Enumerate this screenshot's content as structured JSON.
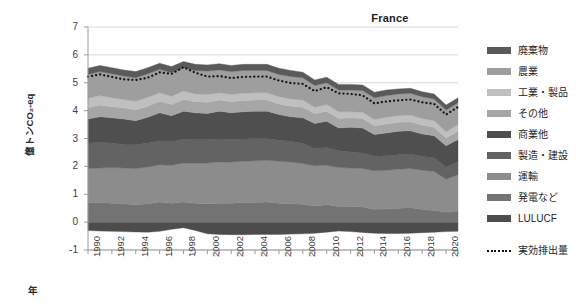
{
  "chart_data": {
    "type": "area",
    "title": "France",
    "xlabel": "年",
    "ylabel": "億トンCO₂-eq",
    "ylim": [
      -1,
      7
    ],
    "y_ticks": [
      7,
      6,
      5,
      4,
      3,
      2,
      1,
      0,
      -1
    ],
    "xlim": [
      1990,
      2021
    ],
    "x_ticks": [
      1990,
      1992,
      1994,
      1996,
      1998,
      2000,
      2002,
      2004,
      2006,
      2008,
      2010,
      2012,
      2014,
      2016,
      2018,
      2020
    ],
    "grid": true,
    "legend_position": "right",
    "stacked": true,
    "x": [
      1990,
      1991,
      1992,
      1993,
      1994,
      1995,
      1996,
      1997,
      1998,
      1999,
      2000,
      2001,
      2002,
      2003,
      2004,
      2005,
      2006,
      2007,
      2008,
      2009,
      2010,
      2011,
      2012,
      2013,
      2014,
      2015,
      2016,
      2017,
      2018,
      2019,
      2020,
      2021
    ],
    "series": [
      {
        "name": "LULUCF",
        "color": "#4c4c4c",
        "stack_order": 0,
        "values": [
          -0.3,
          -0.32,
          -0.33,
          -0.34,
          -0.35,
          -0.36,
          -0.33,
          -0.26,
          -0.2,
          -0.3,
          -0.42,
          -0.44,
          -0.45,
          -0.45,
          -0.44,
          -0.44,
          -0.44,
          -0.43,
          -0.42,
          -0.4,
          -0.36,
          -0.32,
          -0.34,
          -0.37,
          -0.4,
          -0.41,
          -0.41,
          -0.4,
          -0.38,
          -0.36,
          -0.34,
          -0.33
        ]
      },
      {
        "name": "発電など",
        "color": "#737373",
        "stack_order": 1,
        "values": [
          0.7,
          0.7,
          0.68,
          0.66,
          0.62,
          0.66,
          0.72,
          0.68,
          0.72,
          0.68,
          0.66,
          0.68,
          0.68,
          0.7,
          0.7,
          0.72,
          0.68,
          0.66,
          0.64,
          0.58,
          0.62,
          0.56,
          0.56,
          0.54,
          0.46,
          0.48,
          0.5,
          0.52,
          0.46,
          0.42,
          0.36,
          0.4
        ]
      },
      {
        "name": "運輸",
        "color": "#8c8c8c",
        "stack_order": 2,
        "values": [
          1.22,
          1.24,
          1.28,
          1.28,
          1.3,
          1.32,
          1.34,
          1.36,
          1.4,
          1.44,
          1.46,
          1.48,
          1.48,
          1.48,
          1.5,
          1.5,
          1.5,
          1.5,
          1.46,
          1.44,
          1.42,
          1.4,
          1.38,
          1.38,
          1.38,
          1.38,
          1.4,
          1.4,
          1.4,
          1.4,
          1.18,
          1.3
        ]
      },
      {
        "name": "製造・建設",
        "color": "#636363",
        "stack_order": 3,
        "values": [
          0.92,
          0.92,
          0.88,
          0.84,
          0.86,
          0.86,
          0.86,
          0.84,
          0.86,
          0.84,
          0.84,
          0.82,
          0.8,
          0.8,
          0.8,
          0.78,
          0.76,
          0.74,
          0.72,
          0.62,
          0.64,
          0.6,
          0.58,
          0.56,
          0.52,
          0.52,
          0.52,
          0.52,
          0.5,
          0.48,
          0.44,
          0.46
        ]
      },
      {
        "name": "商業他",
        "color": "#4f4f4f",
        "stack_order": 4,
        "values": [
          0.86,
          0.92,
          0.9,
          0.92,
          0.86,
          0.92,
          1.0,
          0.94,
          1.0,
          0.96,
          0.94,
          1.0,
          0.96,
          0.98,
          0.98,
          0.98,
          0.92,
          0.88,
          0.92,
          0.9,
          0.94,
          0.82,
          0.88,
          0.9,
          0.78,
          0.82,
          0.84,
          0.84,
          0.8,
          0.8,
          0.76,
          0.8
        ]
      },
      {
        "name": "その他",
        "color": "#a6a6a6",
        "stack_order": 5,
        "values": [
          0.4,
          0.42,
          0.4,
          0.4,
          0.38,
          0.4,
          0.42,
          0.4,
          0.42,
          0.4,
          0.4,
          0.4,
          0.4,
          0.4,
          0.4,
          0.4,
          0.38,
          0.38,
          0.38,
          0.36,
          0.36,
          0.34,
          0.34,
          0.34,
          0.32,
          0.32,
          0.32,
          0.32,
          0.32,
          0.3,
          0.28,
          0.3
        ]
      },
      {
        "name": "工業・製品",
        "color": "#bfbfbf",
        "stack_order": 6,
        "values": [
          0.34,
          0.34,
          0.32,
          0.3,
          0.32,
          0.32,
          0.3,
          0.3,
          0.3,
          0.28,
          0.28,
          0.26,
          0.26,
          0.26,
          0.26,
          0.26,
          0.26,
          0.26,
          0.26,
          0.22,
          0.24,
          0.24,
          0.22,
          0.22,
          0.22,
          0.24,
          0.24,
          0.24,
          0.24,
          0.24,
          0.22,
          0.24
        ]
      },
      {
        "name": "農業",
        "color": "#9e9e9e",
        "stack_order": 7,
        "values": [
          0.86,
          0.86,
          0.86,
          0.84,
          0.84,
          0.84,
          0.84,
          0.84,
          0.84,
          0.84,
          0.84,
          0.82,
          0.82,
          0.82,
          0.8,
          0.8,
          0.8,
          0.8,
          0.8,
          0.78,
          0.78,
          0.78,
          0.78,
          0.78,
          0.78,
          0.78,
          0.78,
          0.78,
          0.78,
          0.78,
          0.78,
          0.78
        ]
      },
      {
        "name": "廃棄物",
        "color": "#5a5a5a",
        "stack_order": 8,
        "values": [
          0.22,
          0.22,
          0.22,
          0.22,
          0.22,
          0.22,
          0.22,
          0.22,
          0.22,
          0.22,
          0.22,
          0.22,
          0.22,
          0.22,
          0.22,
          0.22,
          0.22,
          0.22,
          0.2,
          0.2,
          0.2,
          0.2,
          0.2,
          0.2,
          0.2,
          0.2,
          0.18,
          0.18,
          0.18,
          0.18,
          0.18,
          0.18
        ]
      }
    ],
    "net_line": {
      "name": "実効排出量",
      "style": "dotted",
      "color": "#111111",
      "values": [
        5.22,
        5.3,
        5.21,
        5.12,
        5.1,
        5.18,
        5.37,
        5.32,
        5.56,
        5.36,
        5.22,
        5.24,
        5.17,
        5.21,
        5.22,
        5.22,
        5.08,
        4.99,
        4.96,
        4.7,
        4.84,
        4.62,
        4.6,
        4.55,
        4.26,
        4.33,
        4.37,
        4.4,
        4.3,
        4.24,
        3.86,
        4.13
      ]
    }
  },
  "legend": {
    "items": [
      {
        "label": "廃棄物",
        "color": "#5a5a5a"
      },
      {
        "label": "農業",
        "color": "#9e9e9e"
      },
      {
        "label": "工業・製品",
        "color": "#bfbfbf"
      },
      {
        "label": "その他",
        "color": "#a6a6a6"
      },
      {
        "label": "商業他",
        "color": "#4f4f4f"
      },
      {
        "label": "製造・建設",
        "color": "#636363"
      },
      {
        "label": "運輸",
        "color": "#8c8c8c"
      },
      {
        "label": "発電など",
        "color": "#737373"
      },
      {
        "label": "LULUCF",
        "color": "#4c4c4c"
      }
    ],
    "net_label": "実効排出量"
  }
}
